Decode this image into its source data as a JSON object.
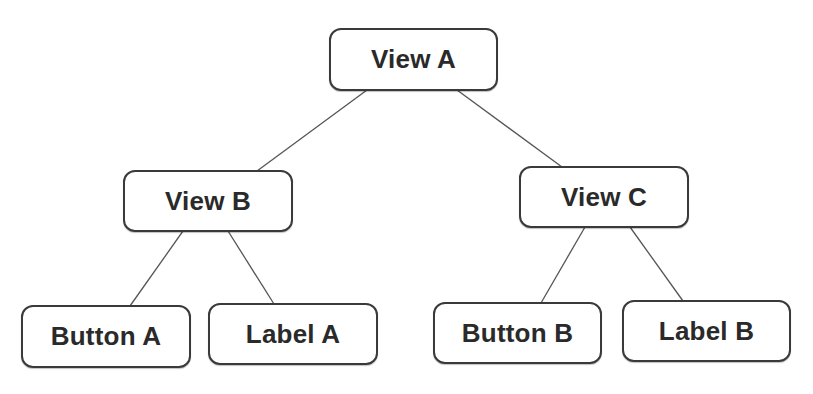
{
  "diagram": {
    "type": "tree",
    "colors": {
      "border": "#3a3a3a",
      "text": "#2a2a2a",
      "edge": "#555555",
      "background": "#ffffff"
    },
    "nodes": [
      {
        "id": "view-a",
        "label": "View A",
        "x": 329,
        "y": 28,
        "w": 169,
        "h": 63
      },
      {
        "id": "view-b",
        "label": "View B",
        "x": 123,
        "y": 170,
        "w": 170,
        "h": 62
      },
      {
        "id": "view-c",
        "label": "View C",
        "x": 519,
        "y": 166,
        "w": 170,
        "h": 62
      },
      {
        "id": "button-a",
        "label": "Button A",
        "x": 21,
        "y": 305,
        "w": 170,
        "h": 63
      },
      {
        "id": "label-a",
        "label": "Label A",
        "x": 208,
        "y": 303,
        "w": 170,
        "h": 62
      },
      {
        "id": "button-b",
        "label": "Button B",
        "x": 433,
        "y": 302,
        "w": 169,
        "h": 62
      },
      {
        "id": "label-b",
        "label": "Label B",
        "x": 622,
        "y": 300,
        "w": 169,
        "h": 62
      }
    ],
    "edges": [
      {
        "from": "view-a",
        "to": "view-b",
        "x1": 367,
        "y1": 90,
        "x2": 257,
        "y2": 171
      },
      {
        "from": "view-a",
        "to": "view-c",
        "x1": 457,
        "y1": 90,
        "x2": 562,
        "y2": 167
      },
      {
        "from": "view-b",
        "to": "button-a",
        "x1": 183,
        "y1": 231,
        "x2": 130,
        "y2": 306
      },
      {
        "from": "view-b",
        "to": "label-a",
        "x1": 228,
        "y1": 231,
        "x2": 274,
        "y2": 304
      },
      {
        "from": "view-c",
        "to": "button-b",
        "x1": 585,
        "y1": 227,
        "x2": 541,
        "y2": 303
      },
      {
        "from": "view-c",
        "to": "label-b",
        "x1": 630,
        "y1": 227,
        "x2": 683,
        "y2": 301
      }
    ]
  }
}
